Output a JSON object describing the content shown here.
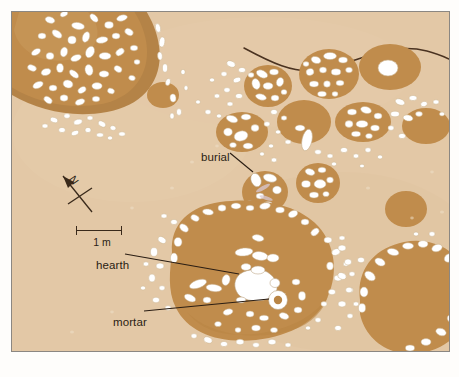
{
  "figure": {
    "kind": "archaeological-site-plan",
    "background_color": "#e3c8a6",
    "feature_fill_color": "#c08c4c",
    "feature_rim_color": "#a9highlight",
    "stone_color": "#ffffff",
    "line_color": "#4a3220",
    "border_color": "#8b8782",
    "page_color": "#fefdfb"
  },
  "annotations": {
    "burial": {
      "label": "burial",
      "leader_from": [
        229,
        152
      ],
      "leader_to": [
        252,
        170
      ]
    },
    "hearth": {
      "label": "hearth",
      "leader_from": [
        124,
        253
      ],
      "leader_to": [
        238,
        273
      ]
    },
    "mortar": {
      "label": "mortar",
      "leader_from": [
        143,
        310
      ],
      "leader_to": [
        266,
        288
      ]
    }
  },
  "scale": {
    "caption": "1 m",
    "length_px": 46,
    "unit": "m",
    "value": 1
  },
  "north_arrow": {
    "letter": "N",
    "bearing_label": "north",
    "direction_deg": -35
  },
  "features": {
    "large_structure_upper_left": {
      "name": "stone-walled round structure",
      "center": [
        92,
        50
      ],
      "radius": 78,
      "has_rim": true,
      "stone_fill": "dense"
    },
    "central_structure": {
      "name": "central occupation floor",
      "center": [
        240,
        275
      ],
      "radius": 88,
      "contains": [
        "hearth",
        "mortar",
        "stone scatter"
      ]
    },
    "large_pit_lower_right": {
      "name": "large stone-ringed pit",
      "center": [
        385,
        300
      ],
      "radius": 62,
      "stone_fill": "perimeter"
    },
    "burial_pit": {
      "name": "burial pit",
      "center": [
        253,
        180
      ],
      "rx": 22,
      "ry": 20
    },
    "pit_count_upper_right": 9
  },
  "trench_line": {
    "name": "wall or trench edge",
    "description": "thin dark curved line crossing the upper part of the plan"
  }
}
